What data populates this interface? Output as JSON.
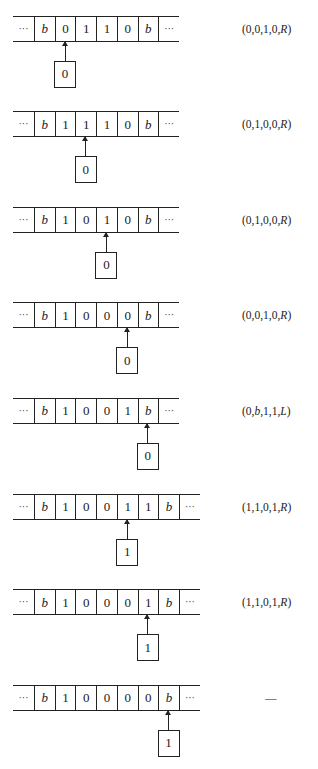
{
  "diagram": {
    "title": "",
    "blank_symbol": "b",
    "ellipsis": "···",
    "configs": [
      {
        "tape": [
          "b",
          "0",
          "1",
          "1",
          "0",
          "b"
        ],
        "head": 1,
        "state": "0",
        "transition": [
          "0",
          "0",
          "1",
          "0",
          "R"
        ]
      },
      {
        "tape": [
          "b",
          "1",
          "1",
          "1",
          "0",
          "b"
        ],
        "head": 2,
        "state": "0",
        "transition": [
          "0",
          "1",
          "0",
          "0",
          "R"
        ]
      },
      {
        "tape": [
          "b",
          "1",
          "0",
          "1",
          "0",
          "b"
        ],
        "head": 3,
        "state": "0",
        "transition": [
          "0",
          "1",
          "0",
          "0",
          "R"
        ]
      },
      {
        "tape": [
          "b",
          "1",
          "0",
          "0",
          "0",
          "b"
        ],
        "head": 4,
        "state": "0",
        "transition": [
          "0",
          "0",
          "1",
          "0",
          "R"
        ]
      },
      {
        "tape": [
          "b",
          "1",
          "0",
          "0",
          "1",
          "b"
        ],
        "head": 5,
        "state": "0",
        "transition": [
          "0",
          "b",
          "1",
          "1",
          "L"
        ]
      },
      {
        "tape": [
          "b",
          "1",
          "0",
          "0",
          "1",
          "1",
          "b"
        ],
        "head": 4,
        "state": "1",
        "transition": [
          "1",
          "1",
          "0",
          "1",
          "R"
        ]
      },
      {
        "tape": [
          "b",
          "1",
          "0",
          "0",
          "0",
          "1",
          "b"
        ],
        "head": 5,
        "state": "1",
        "transition": [
          "1",
          "1",
          "0",
          "1",
          "R"
        ]
      },
      {
        "tape": [
          "b",
          "1",
          "0",
          "0",
          "0",
          "0",
          "b"
        ],
        "head": 6,
        "state": "1",
        "transition": null,
        "transition_text": "—"
      }
    ]
  },
  "colors": {
    "ink": "#222222",
    "background": "#ffffff"
  },
  "layout": {
    "first_top": 15.5,
    "pitch": 95.6,
    "tape_left": 13,
    "dots_width": 21,
    "cell_width": 20.7,
    "tape_height": 26,
    "arrow_length": 19,
    "box_width": 22,
    "box_height": 27
  }
}
